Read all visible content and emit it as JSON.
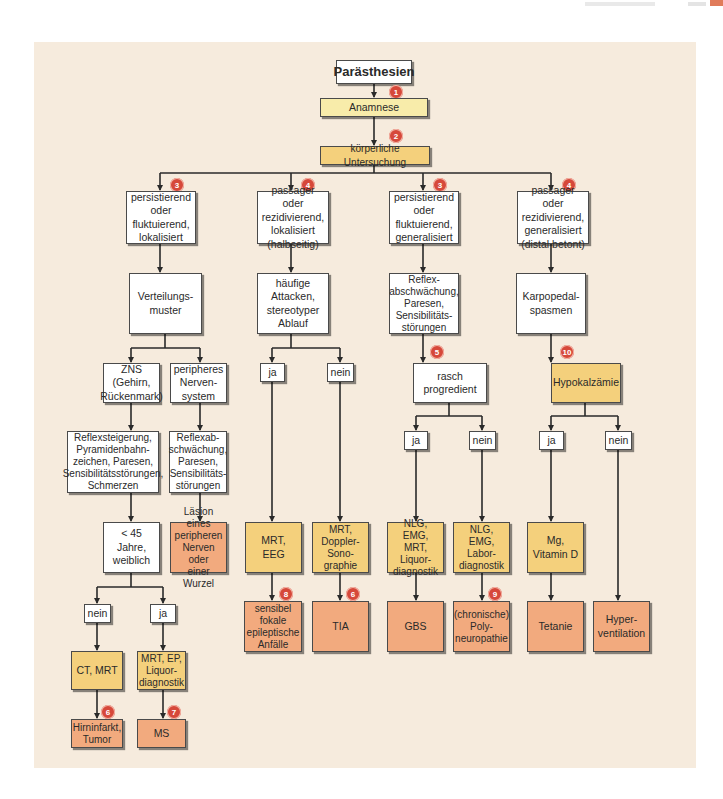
{
  "title": "Parästhesien",
  "colors": {
    "background_panel": "#f6ebdd",
    "box_white": "#ffffff",
    "box_yellow": "#f8ecaa",
    "box_gold": "#f4d07c",
    "box_orange": "#f2aa7e",
    "badge": "#d6483a",
    "line": "#2a2a2a"
  },
  "steps": {
    "anamnese": "Anamnese",
    "untersuchung": "körperliche Untersuchung"
  },
  "branches": [
    {
      "badge": "3",
      "label": "persistierend\noder\nfluktuierend,\nlokalisiert"
    },
    {
      "badge": "4",
      "label": "passager oder\nrezidivierend,\nlokalisiert\n(halbseitig)"
    },
    {
      "badge": "3",
      "label": "persistierend\noder\nfluktuierend,\ngeneralisiert"
    },
    {
      "badge": "4",
      "label": "passager oder\nrezidivierend,\ngeneralisiert\n(distal betont)"
    }
  ],
  "col1": {
    "verteilung": "Verteilungs-\nmuster",
    "zns": "ZNS\n(Gehirn,\nRückenmark)",
    "peripher": "peripheres\nNerven-\nsystem",
    "zns_symptome": "Reflexsteigerung,\nPyramidenbahn-\nzeichen, Paresen,\nSensibilitätsstörungen,\nSchmerzen",
    "peripher_symptome": "Reflexab-\nschwächung,\nParesen,\nSensibilitäts-\nstörungen",
    "alter": "< 45 Jahre,\nweiblich",
    "laesion": "Läsion eines\nperipheren\nNerven oder\neiner Wurzel",
    "nein": "nein",
    "ja": "ja",
    "ct_mrt": "CT, MRT",
    "mrt_ep": "MRT, EP,\nLiquor-\ndiagnostik",
    "hirninfarkt": "Hirninfarkt,\nTumor",
    "ms": "MS",
    "badge_hirninfarkt": "6",
    "badge_ms": "7"
  },
  "col2": {
    "attacken": "häufige\nAttacken,\nstereotyper\nAblauf",
    "ja": "ja",
    "nein": "nein",
    "mrt_eeg": "MRT,\nEEG",
    "mrt_doppler": "MRT,\nDoppler-\nSono-\ngraphie",
    "anfaelle": "sensibel\nfokale\nepileptische\nAnfälle",
    "tia": "TIA",
    "badge_anfaelle": "8",
    "badge_tia": "6"
  },
  "col3": {
    "reflex": "Reflex-\nabschwächung,\nParesen,\nSensibilitäts-\nstörungen",
    "rasch": "rasch\nprogredient",
    "badge_rasch": "5",
    "ja": "ja",
    "nein": "nein",
    "nlg_mrt": "NLG, EMG,\nMRT,\nLiquor-\ndiagnostik",
    "nlg_labor": "NLG, EMG,\nLabor-\ndiagnostik",
    "gbs": "GBS",
    "polyneuropathie": "(chronische)\nPoly-\nneuropathie",
    "badge_poly": "9"
  },
  "col4": {
    "karpopedal": "Karpopedal-\nspasmen",
    "hypokalzaemie": "Hypokalzämie",
    "badge_hypo": "10",
    "ja": "ja",
    "nein": "nein",
    "mg": "Mg,\nVitamin D",
    "tetanie": "Tetanie",
    "hyperventilation": "Hyper-\nventilation"
  },
  "badges": {
    "anamnese": "1",
    "untersuchung": "2"
  }
}
